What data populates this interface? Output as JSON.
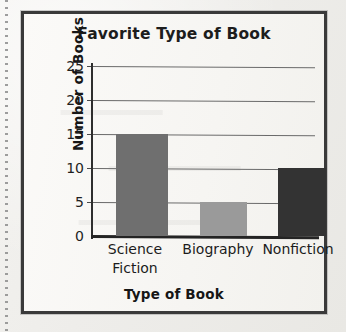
{
  "chart_data": {
    "type": "bar",
    "title": "Favorite Type of Book",
    "xlabel": "Type of Book",
    "ylabel": "Number of Books",
    "categories": [
      "Science Fiction",
      "Biography",
      "Nonfiction"
    ],
    "category_lines": [
      [
        "Science",
        "Fiction"
      ],
      [
        "Biography",
        ""
      ],
      [
        "Nonfiction",
        ""
      ]
    ],
    "values": [
      15,
      5,
      10
    ],
    "ylim": [
      0,
      25
    ],
    "yticks": [
      0,
      5,
      10,
      15,
      20,
      25
    ],
    "ytick_labels": [
      "0",
      "5",
      "10",
      "15",
      "20",
      "25"
    ],
    "grid": "horizontal",
    "legend": "none",
    "bar_colors": [
      "#6f6f6f",
      "#9a9a9a",
      "#333333"
    ]
  },
  "page": {
    "frame_color": "#3a3a3a",
    "paper_color": "#f4f3f0",
    "axis_color": "#2e2e2e",
    "gridline_color": "#6a6a6a"
  }
}
